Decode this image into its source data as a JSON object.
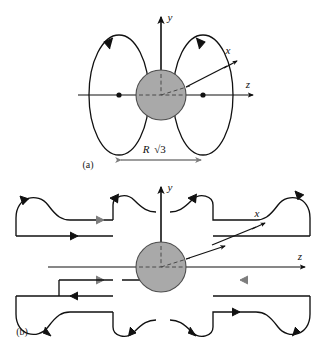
{
  "figure": {
    "type": "physics-field-line-diagram",
    "background_color": "#ffffff",
    "line_color": "#111111",
    "gray_accent_color": "#7d7d7d",
    "sphere_fill_color": "#a9a9a9",
    "sphere_stroke_color": "#4d4d4d"
  },
  "panel_a": {
    "label": "(a)",
    "axes": {
      "y_label": "y",
      "z_label": "z",
      "x_label": "x"
    },
    "dimension": {
      "symbol": "R",
      "radical": "√3",
      "full_text": "R√3"
    },
    "description": "Sphere on the z-axis with two closed circular field loops, left loop circulating counterclockwise and right loop circulating clockwise, separated by a distance R√3",
    "loop_count": 2,
    "focus_dot_count": 2
  },
  "panel_b": {
    "label": "(b)",
    "axes": {
      "y_label": "y",
      "z_label": "z",
      "x_label": "x"
    },
    "description": "Sphere on the z-axis surrounded by extended wave-like magnetic field lines repeating above and below the z-axis",
    "lobe_count": 8
  }
}
